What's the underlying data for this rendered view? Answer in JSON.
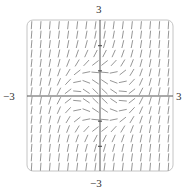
{
  "chart_data": {
    "type": "slope_field",
    "title": "",
    "equation": "dy/dx = x^2 + y^2 - 1",
    "xlim": [
      -3,
      3
    ],
    "ylim": [
      -3,
      3
    ],
    "grid": {
      "cols": 16,
      "rows": 16
    },
    "axis_tick_labels": {
      "top": "3",
      "bottom": "−3",
      "left": "−3",
      "right": "3"
    },
    "y_axis_ticks": [
      -2,
      -1,
      1,
      2
    ],
    "frame": "rounded-rectangle",
    "colors": {
      "segments": "#8a8a8a",
      "axes": "#555555",
      "frame": "#bbbbbb"
    }
  },
  "labels": {
    "top": "3",
    "bottom": "−3",
    "left": "−3",
    "right": "3"
  }
}
